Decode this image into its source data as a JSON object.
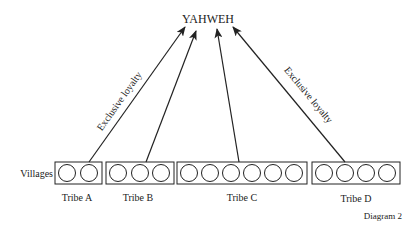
{
  "diagram": {
    "top_label": "YAHWEH",
    "row_label": "Villages",
    "caption": "Diagram 2",
    "arrow_labels": {
      "left": "Exclusive loyalty",
      "right": "Exclusive loyalty"
    },
    "tribes": [
      {
        "name": "Tribe A",
        "villages": 2
      },
      {
        "name": "Tribe B",
        "villages": 3
      },
      {
        "name": "Tribe C",
        "villages": 6
      },
      {
        "name": "Tribe D",
        "villages": 4
      }
    ]
  },
  "colors": {
    "stroke": "#222222",
    "background": "#ffffff"
  }
}
